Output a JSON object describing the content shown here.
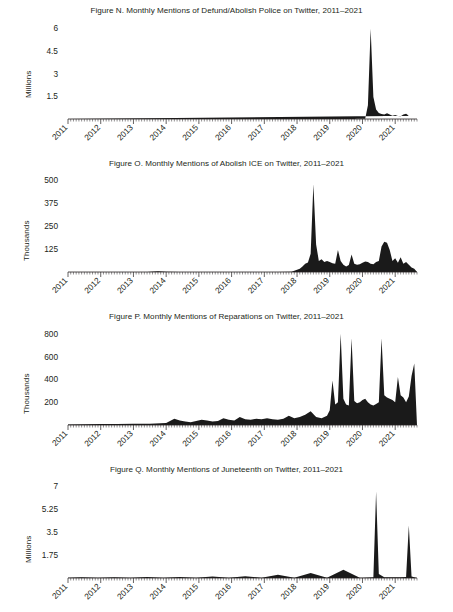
{
  "page": {
    "background": "#ffffff",
    "ink": "#231f20",
    "series_color": "#1a1a1a"
  },
  "figures": [
    {
      "id": "figure-n",
      "title": "Figure N. Monthly Mentions of Defund/Abolish Police on Twitter, 2011–2021",
      "ylabel": "Millions"
    },
    {
      "id": "figure-o",
      "title": "Figure O. Monthly Mentions of Abolish ICE on Twitter, 2011–2021",
      "ylabel": "Thousands"
    },
    {
      "id": "figure-p",
      "title": "Figure P. Monthly Mentions of Reparations on Twitter, 2011–2021",
      "ylabel": "Thousands"
    },
    {
      "id": "figure-q",
      "title": "Figure Q. Monthly Mentions of Juneteenth on Twitter, 2011–2021",
      "ylabel": "Millions"
    }
  ],
  "chart_data": [
    {
      "type": "area",
      "title": "Figure N. Monthly Mentions of Defund/Abolish Police on Twitter, 2011–2021",
      "xlabel": "",
      "ylabel": "Millions",
      "unit": "millions",
      "grid": false,
      "legend": null,
      "ylim": [
        0,
        6.4
      ],
      "yticks": [
        1.5,
        3,
        4.5,
        6
      ],
      "ytick_labels": [
        "1.5",
        "3",
        "4.5",
        "6"
      ],
      "xlim": [
        "2011-01",
        "2021-09"
      ],
      "xticks": [
        "2011",
        "2012",
        "2013",
        "2014",
        "2015",
        "2016",
        "2017",
        "2018",
        "2019",
        "2020",
        "2021"
      ],
      "xtick_labels": [
        "2011",
        "2012",
        "2013",
        "2014",
        "2015",
        "2016",
        "2017",
        "2018",
        "2019",
        "2020",
        "2021"
      ],
      "x": [
        "2011-01",
        "2011-02",
        "2011-03",
        "2011-04",
        "2011-05",
        "2011-06",
        "2011-07",
        "2011-08",
        "2011-09",
        "2011-10",
        "2011-11",
        "2011-12",
        "2012-01",
        "2012-02",
        "2012-03",
        "2012-04",
        "2012-05",
        "2012-06",
        "2012-07",
        "2012-08",
        "2012-09",
        "2012-10",
        "2012-11",
        "2012-12",
        "2013-01",
        "2013-02",
        "2013-03",
        "2013-04",
        "2013-05",
        "2013-06",
        "2013-07",
        "2013-08",
        "2013-09",
        "2013-10",
        "2013-11",
        "2013-12",
        "2014-01",
        "2014-02",
        "2014-03",
        "2014-04",
        "2014-05",
        "2014-06",
        "2014-07",
        "2014-08",
        "2014-09",
        "2014-10",
        "2014-11",
        "2014-12",
        "2015-01",
        "2015-02",
        "2015-03",
        "2015-04",
        "2015-05",
        "2015-06",
        "2015-07",
        "2015-08",
        "2015-09",
        "2015-10",
        "2015-11",
        "2015-12",
        "2016-01",
        "2016-02",
        "2016-03",
        "2016-04",
        "2016-05",
        "2016-06",
        "2016-07",
        "2016-08",
        "2016-09",
        "2016-10",
        "2016-11",
        "2016-12",
        "2017-01",
        "2017-02",
        "2017-03",
        "2017-04",
        "2017-05",
        "2017-06",
        "2017-07",
        "2017-08",
        "2017-09",
        "2017-10",
        "2017-11",
        "2017-12",
        "2018-01",
        "2018-02",
        "2018-03",
        "2018-04",
        "2018-05",
        "2018-06",
        "2018-07",
        "2018-08",
        "2018-09",
        "2018-10",
        "2018-11",
        "2018-12",
        "2019-01",
        "2019-02",
        "2019-03",
        "2019-04",
        "2019-05",
        "2019-06",
        "2019-07",
        "2019-08",
        "2019-09",
        "2019-10",
        "2019-11",
        "2019-12",
        "2020-01",
        "2020-02",
        "2020-03",
        "2020-04",
        "2020-05",
        "2020-06",
        "2020-07",
        "2020-08",
        "2020-09",
        "2020-10",
        "2020-11",
        "2020-12",
        "2021-01",
        "2021-02",
        "2021-03",
        "2021-04",
        "2021-05",
        "2021-06",
        "2021-07",
        "2021-08"
      ],
      "values": [
        0,
        0,
        0,
        0,
        0,
        0,
        0,
        0,
        0,
        0,
        0,
        0,
        0,
        0,
        0,
        0,
        0,
        0,
        0,
        0,
        0,
        0,
        0,
        0,
        0,
        0,
        0,
        0,
        0,
        0,
        0,
        0,
        0,
        0,
        0,
        0,
        0,
        0,
        0,
        0,
        0,
        0,
        0,
        0,
        0,
        0,
        0,
        0,
        0,
        0,
        0,
        0,
        0,
        0,
        0,
        0,
        0,
        0,
        0,
        0,
        0,
        0,
        0,
        0,
        0,
        0,
        0,
        0,
        0,
        0,
        0,
        0,
        0,
        0,
        0,
        0,
        0,
        0,
        0,
        0,
        0,
        0,
        0,
        0,
        0,
        0,
        0,
        0,
        0,
        0,
        0,
        0,
        0,
        0,
        0,
        0,
        0,
        0,
        0,
        0,
        0,
        0,
        0,
        0,
        0,
        0,
        0.01,
        0.01,
        0.02,
        0.02,
        0.9,
        5.95,
        1.45,
        0.62,
        0.4,
        0.33,
        0.3,
        0.38,
        0.3,
        0.22,
        0.26,
        0.2,
        0.18,
        0.3,
        0.34,
        0.22
      ]
    },
    {
      "type": "area",
      "title": "Figure O. Monthly Mentions of Abolish ICE on Twitter, 2011–2021",
      "xlabel": "",
      "ylabel": "Thousands",
      "unit": "thousands",
      "grid": false,
      "legend": null,
      "ylim": [
        0,
        530
      ],
      "yticks": [
        125,
        250,
        375,
        500
      ],
      "ytick_labels": [
        "125",
        "250",
        "375",
        "500"
      ],
      "xlim": [
        "2011-01",
        "2021-09"
      ],
      "xticks": [
        "2011",
        "2012",
        "2013",
        "2014",
        "2015",
        "2016",
        "2017",
        "2018",
        "2019",
        "2020",
        "2021"
      ],
      "xtick_labels": [
        "2011",
        "2012",
        "2013",
        "2014",
        "2015",
        "2016",
        "2017",
        "2018",
        "2019",
        "2020",
        "2021"
      ],
      "x": [
        "2011-01",
        "2011-06",
        "2012-01",
        "2012-06",
        "2013-01",
        "2013-06",
        "2013-10",
        "2014-01",
        "2014-06",
        "2015-01",
        "2015-06",
        "2016-01",
        "2016-06",
        "2017-01",
        "2017-06",
        "2017-11",
        "2018-01",
        "2018-02",
        "2018-03",
        "2018-04",
        "2018-05",
        "2018-06",
        "2018-07",
        "2018-08",
        "2018-09",
        "2018-10",
        "2018-11",
        "2018-12",
        "2019-01",
        "2019-02",
        "2019-03",
        "2019-04",
        "2019-05",
        "2019-06",
        "2019-07",
        "2019-08",
        "2019-09",
        "2019-10",
        "2019-11",
        "2019-12",
        "2020-01",
        "2020-02",
        "2020-03",
        "2020-04",
        "2020-05",
        "2020-06",
        "2020-07",
        "2020-08",
        "2020-09",
        "2020-10",
        "2020-11",
        "2020-12",
        "2021-01",
        "2021-02",
        "2021-03",
        "2021-04",
        "2021-05",
        "2021-06",
        "2021-07",
        "2021-08"
      ],
      "values": [
        0,
        0,
        0,
        0,
        0,
        0,
        4,
        1,
        0,
        0,
        0,
        0,
        0,
        0,
        0,
        2,
        12,
        18,
        30,
        45,
        52,
        100,
        480,
        150,
        60,
        70,
        55,
        60,
        55,
        48,
        45,
        120,
        60,
        40,
        30,
        38,
        95,
        45,
        40,
        42,
        50,
        58,
        55,
        45,
        42,
        55,
        60,
        140,
        165,
        160,
        120,
        60,
        75,
        50,
        80,
        45,
        55,
        40,
        25,
        18
      ]
    },
    {
      "type": "area",
      "title": "Figure P. Monthly Mentions of Reparations on Twitter, 2011–2021",
      "xlabel": "",
      "ylabel": "Thousands",
      "unit": "thousands",
      "grid": false,
      "legend": null,
      "ylim": [
        0,
        850
      ],
      "yticks": [
        200,
        400,
        600,
        800
      ],
      "ytick_labels": [
        "200",
        "400",
        "600",
        "800"
      ],
      "xlim": [
        "2011-01",
        "2021-09"
      ],
      "xticks": [
        "2011",
        "2012",
        "2013",
        "2014",
        "2015",
        "2016",
        "2017",
        "2018",
        "2019",
        "2020",
        "2021"
      ],
      "xtick_labels": [
        "2011",
        "2012",
        "2013",
        "2014",
        "2015",
        "2016",
        "2017",
        "2018",
        "2019",
        "2020",
        "2021"
      ],
      "x": [
        "2011-01",
        "2011-07",
        "2012-01",
        "2012-07",
        "2013-01",
        "2013-07",
        "2014-01",
        "2014-04",
        "2014-06",
        "2014-08",
        "2014-10",
        "2014-12",
        "2015-02",
        "2015-04",
        "2015-06",
        "2015-08",
        "2015-10",
        "2015-12",
        "2016-02",
        "2016-04",
        "2016-06",
        "2016-08",
        "2016-10",
        "2016-12",
        "2017-02",
        "2017-04",
        "2017-06",
        "2017-08",
        "2017-10",
        "2017-12",
        "2018-02",
        "2018-04",
        "2018-06",
        "2018-08",
        "2018-10",
        "2018-12",
        "2019-01",
        "2019-02",
        "2019-03",
        "2019-04",
        "2019-05",
        "2019-06",
        "2019-07",
        "2019-08",
        "2019-09",
        "2019-10",
        "2019-11",
        "2019-12",
        "2020-01",
        "2020-02",
        "2020-03",
        "2020-04",
        "2020-05",
        "2020-06",
        "2020-07",
        "2020-08",
        "2020-09",
        "2020-10",
        "2020-11",
        "2020-12",
        "2021-01",
        "2021-02",
        "2021-03",
        "2021-04",
        "2021-05",
        "2021-06",
        "2021-07",
        "2021-08"
      ],
      "values": [
        5,
        6,
        8,
        8,
        10,
        12,
        18,
        55,
        40,
        30,
        25,
        35,
        45,
        40,
        30,
        35,
        60,
        45,
        40,
        70,
        50,
        45,
        55,
        50,
        60,
        50,
        45,
        55,
        80,
        60,
        70,
        90,
        120,
        70,
        60,
        80,
        130,
        390,
        180,
        200,
        800,
        230,
        180,
        170,
        760,
        210,
        190,
        200,
        220,
        230,
        200,
        180,
        170,
        185,
        200,
        760,
        260,
        240,
        230,
        220,
        200,
        420,
        260,
        240,
        200,
        250,
        430,
        540
      ]
    },
    {
      "type": "area",
      "title": "Figure Q. Monthly Mentions of Juneteenth on Twitter, 2011–2021",
      "xlabel": "",
      "ylabel": "Millions",
      "unit": "millions",
      "grid": false,
      "legend": null,
      "ylim": [
        0,
        7.4
      ],
      "yticks": [
        1.75,
        3.5,
        5.25,
        7
      ],
      "ytick_labels": [
        "1.75",
        "3.5",
        "5.25",
        "7"
      ],
      "xlim": [
        "2011-01",
        "2021-09"
      ],
      "xticks": [
        "2011",
        "2012",
        "2013",
        "2014",
        "2015",
        "2016",
        "2017",
        "2018",
        "2019",
        "2020",
        "2021"
      ],
      "xtick_labels": [
        "2011",
        "2012",
        "2013",
        "2014",
        "2015",
        "2016",
        "2017",
        "2018",
        "2019",
        "2020",
        "2021"
      ],
      "x": [
        "2011-01",
        "2011-06",
        "2011-12",
        "2012-06",
        "2012-12",
        "2013-06",
        "2013-12",
        "2014-06",
        "2014-12",
        "2015-06",
        "2015-12",
        "2016-06",
        "2016-12",
        "2017-06",
        "2017-12",
        "2018-06",
        "2018-12",
        "2019-06",
        "2019-12",
        "2020-01",
        "2020-03",
        "2020-05",
        "2020-06",
        "2020-07",
        "2020-09",
        "2020-12",
        "2021-03",
        "2021-05",
        "2021-06",
        "2021-07",
        "2021-08"
      ],
      "values": [
        0.01,
        0.05,
        0.01,
        0.06,
        0.01,
        0.07,
        0.01,
        0.08,
        0.01,
        0.12,
        0.01,
        0.14,
        0.01,
        0.25,
        0.01,
        0.38,
        0.01,
        0.62,
        0.02,
        0.02,
        0.03,
        0.05,
        6.6,
        0.3,
        0.05,
        0.05,
        0.06,
        0.08,
        4.0,
        0.12,
        0.05
      ]
    }
  ]
}
